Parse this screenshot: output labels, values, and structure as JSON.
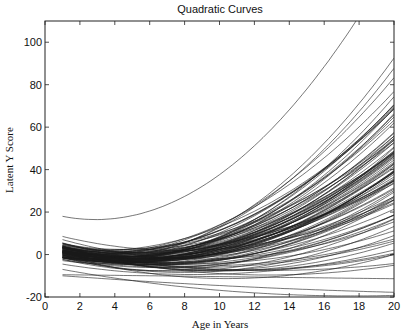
{
  "chart_data": {
    "type": "line",
    "title": "Quadratic Curves",
    "xlabel": "Age in Years",
    "ylabel": "Latent Y Score",
    "xlim": [
      0,
      20
    ],
    "ylim": [
      -20,
      110
    ],
    "xticks": [
      0,
      2,
      4,
      6,
      8,
      10,
      12,
      14,
      16,
      18,
      20
    ],
    "yticks": [
      -20,
      0,
      20,
      40,
      60,
      80,
      100
    ],
    "grid": false,
    "legend": null,
    "x_start": 1,
    "x_end": 20,
    "model": "y = a + b*(age-1) + c*(age-1)^2",
    "n_curves": 100,
    "highlighted_curves": [
      {
        "name": "top envelope",
        "a": 18,
        "b": -1.6,
        "c": 0.42
      },
      {
        "name": "flat low curve",
        "a": -9.5,
        "b": -0.1,
        "c": 0.0
      },
      {
        "name": "declining curve",
        "a": -7,
        "b": -1.5,
        "c": 0.045
      },
      {
        "name": "lowest curve",
        "a": -10,
        "b": -0.6,
        "c": 0.01
      }
    ],
    "approx_values": {
      "age_1_range": [
        -10,
        18
      ],
      "age_1_dense_range": [
        -5,
        8
      ],
      "age_20_range": [
        -14,
        110
      ],
      "top_curve_reaches_110_at_age": 16.5
    }
  },
  "plot": {
    "left": 45,
    "right": 394,
    "top": 21,
    "bottom": 297,
    "line_color": "#1a1a1a",
    "axis_color": "#222222"
  }
}
